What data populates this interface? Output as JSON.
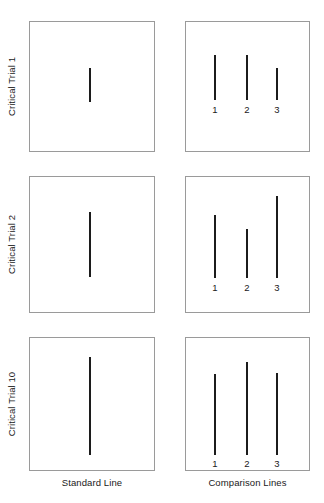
{
  "figure": {
    "width": 324,
    "height": 503,
    "background_color": "#ffffff",
    "line_color": "#1c1c1c",
    "box_border_color": "#9a9a9a",
    "text_color": "#1a1a1a"
  },
  "columns": {
    "standard_caption": "Standard Line",
    "comparison_caption": "Comparison Lines"
  },
  "rows": [
    {
      "label": "Critical Trial 1",
      "panel_top": 21,
      "panel_bottom": 152,
      "standard": {
        "x": 90,
        "top": 68,
        "bottom": 102
      },
      "comparison": [
        {
          "number": "1",
          "x": 215,
          "top": 55,
          "bottom": 100,
          "label_y": 104
        },
        {
          "number": "2",
          "x": 247,
          "top": 55,
          "bottom": 100,
          "label_y": 104
        },
        {
          "number": "3",
          "x": 277,
          "top": 68,
          "bottom": 100,
          "label_y": 104
        }
      ]
    },
    {
      "label": "Critical Trial 2",
      "panel_top": 176,
      "panel_bottom": 313,
      "standard": {
        "x": 90,
        "top": 212,
        "bottom": 277
      },
      "comparison": [
        {
          "number": "1",
          "x": 215,
          "top": 215,
          "bottom": 278,
          "label_y": 282
        },
        {
          "number": "2",
          "x": 247,
          "top": 229,
          "bottom": 278,
          "label_y": 282
        },
        {
          "number": "3",
          "x": 277,
          "top": 196,
          "bottom": 278,
          "label_y": 282
        }
      ]
    },
    {
      "label": "Critical Trial 10",
      "panel_top": 337,
      "panel_bottom": 471,
      "standard": {
        "x": 90,
        "top": 357,
        "bottom": 455
      },
      "comparison": [
        {
          "number": "1",
          "x": 215,
          "top": 374,
          "bottom": 455,
          "label_y": 458
        },
        {
          "number": "2",
          "x": 247,
          "top": 362,
          "bottom": 455,
          "label_y": 458
        },
        {
          "number": "3",
          "x": 277,
          "top": 373,
          "bottom": 455,
          "label_y": 458
        }
      ]
    }
  ],
  "captions": {
    "y": 477
  }
}
